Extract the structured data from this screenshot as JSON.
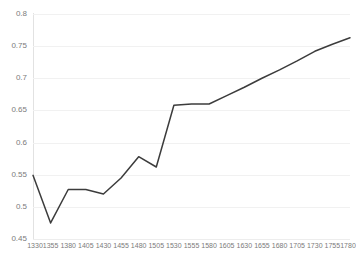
{
  "chart_data": {
    "type": "line",
    "title": "",
    "subtitle": "",
    "xlabel": "",
    "ylabel": "",
    "grid": true,
    "legend": false,
    "legend_position": "none",
    "xlim": [
      1330,
      1780
    ],
    "ylim": [
      0.45,
      0.8
    ],
    "y_tick_step": 0.05,
    "x_tick_step": 25,
    "y_ticks": [
      "0.8",
      "0.75",
      "0.7",
      "0.65",
      "0.6",
      "0.55",
      "0.5",
      "0.45"
    ],
    "y_tick_values": [
      0.8,
      0.75,
      0.7,
      0.65,
      0.6,
      0.55,
      0.5,
      0.45
    ],
    "categories": [
      "1330",
      "1355",
      "1380",
      "1405",
      "1430",
      "1455",
      "1480",
      "1505",
      "1530",
      "1555",
      "1580",
      "1605",
      "1630",
      "1655",
      "1680",
      "1705",
      "1730",
      "1755",
      "1780"
    ],
    "x": [
      1330,
      1355,
      1380,
      1405,
      1430,
      1455,
      1480,
      1505,
      1530,
      1555,
      1580,
      1605,
      1630,
      1655,
      1680,
      1705,
      1730,
      1755,
      1780
    ],
    "values": [
      0.549,
      0.475,
      0.527,
      0.527,
      0.52,
      0.545,
      0.578,
      0.562,
      0.658,
      0.66,
      0.66,
      0.673,
      0.686,
      0.7,
      0.713,
      0.727,
      0.742,
      0.753,
      0.763
    ],
    "series": [
      {
        "name": "series-1",
        "color": "#3c3c3c",
        "values": [
          0.549,
          0.475,
          0.527,
          0.527,
          0.52,
          0.545,
          0.578,
          0.562,
          0.658,
          0.66,
          0.66,
          0.673,
          0.686,
          0.7,
          0.713,
          0.727,
          0.742,
          0.753,
          0.763
        ]
      }
    ],
    "annotations": []
  },
  "style": {
    "line_color": "#3c3c3c",
    "grid_color": "#f1f1f1",
    "axis_color": "#e2e2e2",
    "tick_label_color": "#7b7b7b",
    "background": "#ffffff"
  }
}
